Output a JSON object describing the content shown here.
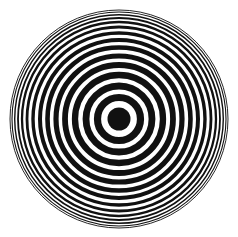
{
  "figure": {
    "alt_text": "Black and white concentric circles forming a bullseye target pattern",
    "width": 238,
    "height": 237,
    "background_color": "#ffffff",
    "ink_color": "#111111"
  },
  "chart_data": {
    "type": "scatter",
    "subtitle": "",
    "xlabel": "",
    "ylabel": "",
    "grid": false,
    "legend": "none",
    "axis_visible": false,
    "tick_labels": [],
    "annotations": [],
    "center": {
      "x": 119,
      "y": 119
    },
    "units": "pixels",
    "xlim": [
      0,
      238
    ],
    "ylim": [
      0,
      237
    ],
    "outer_radius": 109,
    "ring_count": 14,
    "center_disc_radius": 11.5,
    "center_disc_fill": "#111111",
    "rings": [
      {
        "index": 1,
        "radius": 21.5,
        "stroke_width": 7.2
      },
      {
        "index": 2,
        "radius": 33.0,
        "stroke_width": 6.8
      },
      {
        "index": 3,
        "radius": 44.0,
        "stroke_width": 6.3
      },
      {
        "index": 4,
        "radius": 54.0,
        "stroke_width": 5.8
      },
      {
        "index": 5,
        "radius": 63.0,
        "stroke_width": 5.2
      },
      {
        "index": 6,
        "radius": 71.5,
        "stroke_width": 4.6
      },
      {
        "index": 7,
        "radius": 79.0,
        "stroke_width": 4.0
      },
      {
        "index": 8,
        "radius": 86.0,
        "stroke_width": 3.4
      },
      {
        "index": 9,
        "radius": 92.0,
        "stroke_width": 2.8
      },
      {
        "index": 10,
        "radius": 97.0,
        "stroke_width": 2.3
      },
      {
        "index": 11,
        "radius": 101.0,
        "stroke_width": 1.8
      },
      {
        "index": 12,
        "radius": 104.3,
        "stroke_width": 1.4
      },
      {
        "index": 13,
        "radius": 107.0,
        "stroke_width": 1.1
      },
      {
        "index": 14,
        "radius": 109.0,
        "stroke_width": 0.9
      }
    ]
  }
}
